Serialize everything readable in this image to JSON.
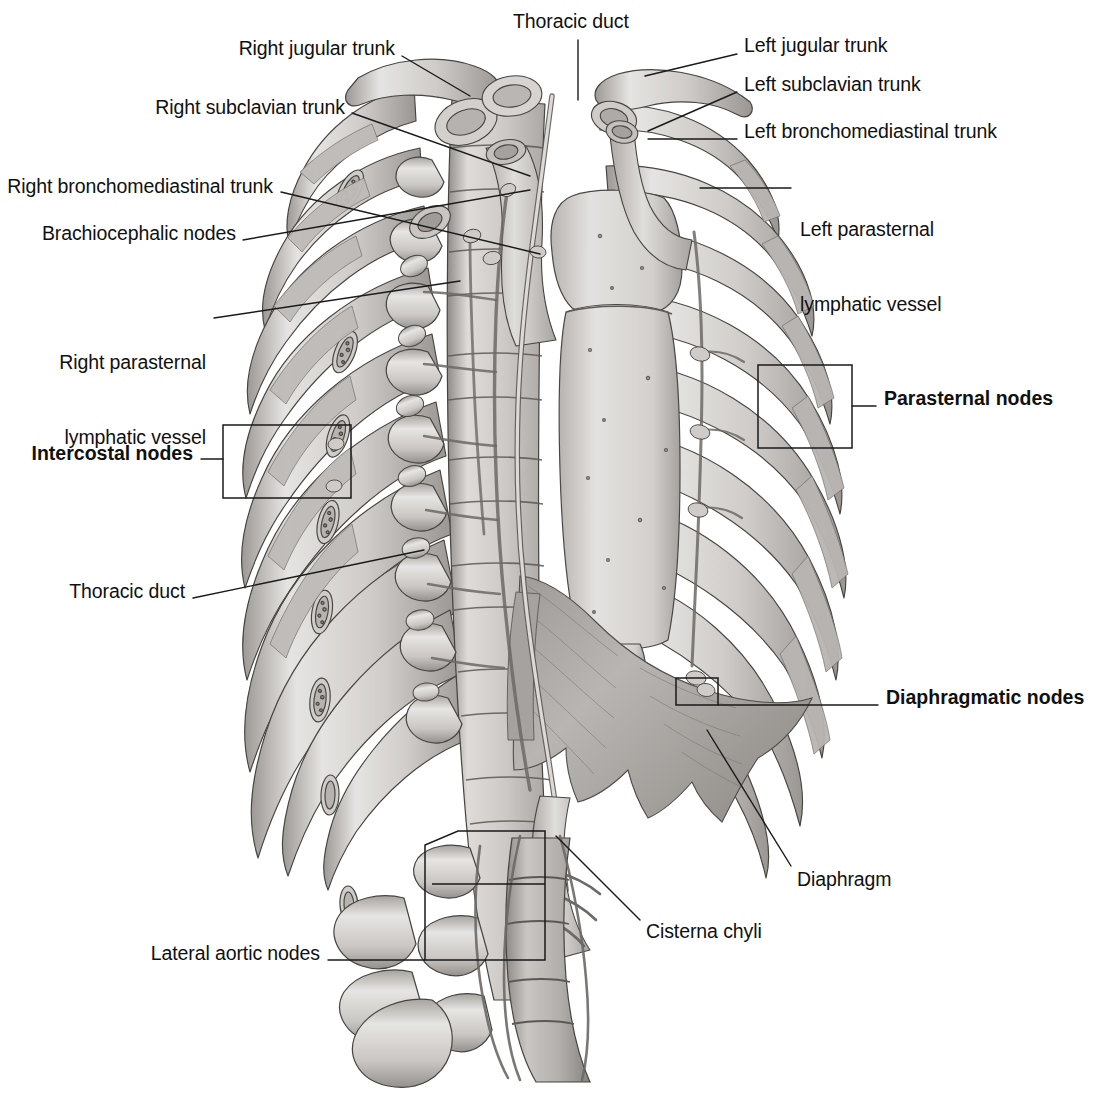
{
  "figure": {
    "background_color": "#ffffff",
    "line_color": "#1a1a1a",
    "text_color": "#101010"
  },
  "labels": [
    {
      "id": "right-jugular-trunk",
      "text": "Right jugular trunk",
      "bold": false,
      "align": "right",
      "x": 395,
      "y": 45,
      "lines": [
        "Right jugular trunk"
      ]
    },
    {
      "id": "thoracic-duct-top",
      "text": "Thoracic duct",
      "bold": false,
      "align": "left",
      "x": 513,
      "y": 17,
      "lines": [
        "Thoracic duct"
      ]
    },
    {
      "id": "left-jugular-trunk",
      "text": "Left jugular trunk",
      "bold": false,
      "align": "left",
      "x": 744,
      "y": 42,
      "lines": [
        "Left jugular trunk"
      ]
    },
    {
      "id": "right-subclavian-trunk",
      "text": "Right subclavian trunk",
      "bold": false,
      "align": "right",
      "x": 345,
      "y": 104,
      "lines": [
        "Right subclavian trunk"
      ]
    },
    {
      "id": "left-subclavian-trunk",
      "text": "Left subclavian trunk",
      "bold": false,
      "align": "left",
      "x": 744,
      "y": 81,
      "lines": [
        "Left subclavian trunk"
      ]
    },
    {
      "id": "left-bronchomediastinal-trunk",
      "text": "Left bronchomediastinal trunk",
      "bold": false,
      "align": "left",
      "x": 744,
      "y": 128,
      "lines": [
        "Left bronchomediastinal trunk"
      ]
    },
    {
      "id": "right-bronchomediastinal-trunk",
      "text": "Right bronchomediastinal trunk",
      "bold": false,
      "align": "right",
      "x": 273,
      "y": 184,
      "lines": [
        "Right bronchomediastinal trunk"
      ]
    },
    {
      "id": "left-parasternal-lymphatic-vessel",
      "text": "Left parasternal lymphatic vessel",
      "bold": false,
      "align": "left",
      "x": 800,
      "y": 176,
      "lines": [
        "Left parasternal",
        "lymphatic vessel"
      ]
    },
    {
      "id": "brachiocephalic-nodes",
      "text": "Brachiocephalic nodes",
      "bold": false,
      "align": "right",
      "x": 236,
      "y": 230,
      "lines": [
        "Brachiocephalic nodes"
      ]
    },
    {
      "id": "right-parasternal-lymphatic-vessel",
      "text": "Right parasternal lymphatic vessel",
      "bold": false,
      "align": "right",
      "x": 206,
      "y": 309,
      "lines": [
        "Right parasternal",
        "lymphatic vessel"
      ]
    },
    {
      "id": "parasternal-nodes",
      "text": "Parasternal nodes",
      "bold": true,
      "align": "left",
      "x": 884,
      "y": 395,
      "lines": [
        "Parasternal nodes"
      ]
    },
    {
      "id": "intercostal-nodes",
      "text": "Intercostal nodes",
      "bold": true,
      "align": "right",
      "x": 193,
      "y": 450,
      "lines": [
        "Intercostal nodes"
      ]
    },
    {
      "id": "thoracic-duct-mid",
      "text": "Thoracic duct",
      "bold": false,
      "align": "right",
      "x": 185,
      "y": 588,
      "lines": [
        "Thoracic duct"
      ]
    },
    {
      "id": "diaphragmatic-nodes",
      "text": "Diaphragmatic nodes",
      "bold": true,
      "align": "left",
      "x": 886,
      "y": 694,
      "lines": [
        "Diaphragmatic nodes"
      ]
    },
    {
      "id": "diaphragm",
      "text": "Diaphragm",
      "bold": false,
      "align": "left",
      "x": 797,
      "y": 876,
      "lines": [
        "Diaphragm"
      ]
    },
    {
      "id": "cisterna-chyli",
      "text": "Cisterna chyli",
      "bold": false,
      "align": "left",
      "x": 646,
      "y": 928,
      "lines": [
        "Cisterna chyli"
      ]
    },
    {
      "id": "lateral-aortic-nodes",
      "text": "Lateral aortic nodes",
      "bold": false,
      "align": "right",
      "x": 320,
      "y": 950,
      "lines": [
        "Lateral aortic nodes"
      ]
    }
  ],
  "leader_lines": [
    {
      "id": "leader-right-jugular-trunk",
      "points": "402,56 470,96"
    },
    {
      "id": "leader-thoracic-duct-top",
      "points": "578,42 578,98"
    },
    {
      "id": "leader-left-jugular-trunk",
      "points": "737,54 645,76"
    },
    {
      "id": "leader-right-subclavian-trunk",
      "points": "352,113 530,174"
    },
    {
      "id": "leader-left-subclavian-trunk",
      "points": "737,92 648,131"
    },
    {
      "id": "leader-left-bronchomediastinal-trunk",
      "points": "737,139 648,139"
    },
    {
      "id": "leader-right-bronchomediastinal-trunk",
      "points": "281,192 538,252"
    },
    {
      "id": "leader-left-parasternal-vessel",
      "points": "791,188 702,188"
    },
    {
      "id": "leader-brachiocephalic-nodes",
      "points": "243,239 528,190"
    },
    {
      "id": "leader-right-parasternal-vessel",
      "points": "214,318 457,281"
    },
    {
      "id": "leader-parasternal-nodes",
      "points": "876,406 852,406"
    },
    {
      "id": "leader-intercostal-nodes",
      "points": "201,459 223,459"
    },
    {
      "id": "leader-thoracic-duct-mid",
      "points": "193,598 420,552"
    },
    {
      "id": "leader-diaphragmatic-nodes",
      "points": "878,705 718,705"
    },
    {
      "id": "leader-diaphragm",
      "points": "791,867 707,730"
    },
    {
      "id": "leader-cisterna-chyli",
      "points": "640,920 556,836"
    },
    {
      "id": "leader-lateral-aortic-nodes",
      "points": "328,960 425,960"
    }
  ],
  "bracket_boxes": [
    {
      "id": "bracket-intercostal-nodes",
      "x": 223,
      "y": 425,
      "width": 128,
      "height": 73,
      "shape": "rect"
    },
    {
      "id": "bracket-parasternal-nodes",
      "x": 758,
      "y": 365,
      "width": 94,
      "height": 83,
      "shape": "rect"
    },
    {
      "id": "bracket-diaphragmatic-nodes",
      "x": 676,
      "y": 678,
      "width": 42,
      "height": 27,
      "shape": "rect"
    },
    {
      "id": "bracket-lateral-aortic-nodes",
      "x": 425,
      "y": 831,
      "width": 120,
      "height": 129,
      "shape": "trapezoid"
    }
  ],
  "anatomy_parts": [
    {
      "id": "rib-cage",
      "name": "rib cage"
    },
    {
      "id": "vertebral-column",
      "name": "vertebral column"
    },
    {
      "id": "sternum",
      "name": "sternum"
    },
    {
      "id": "clavicle",
      "name": "clavicle"
    },
    {
      "id": "diaphragm-muscle",
      "name": "diaphragm"
    },
    {
      "id": "thoracic-duct-vessel",
      "name": "thoracic duct"
    },
    {
      "id": "cisterna-chyli-sac",
      "name": "cisterna chyli"
    },
    {
      "id": "aorta",
      "name": "descending aorta"
    },
    {
      "id": "lymph-nodes",
      "name": "lymph nodes"
    }
  ],
  "palette": {
    "bone_light": "#e8e6e4",
    "bone_mid": "#cfccc9",
    "bone_dark": "#a9a5a2",
    "bone_shadow": "#8e8a87",
    "outline": "#3b3a39",
    "soft_tissue": "#bdb9b6",
    "soft_tissue_dark": "#9b9794",
    "vessel": "#d6d3d0"
  }
}
